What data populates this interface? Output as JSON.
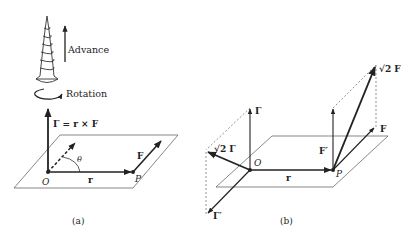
{
  "figure": {
    "panel_a": {
      "caption": "(a)",
      "screw": {
        "advance_label": "Advance",
        "rotation_label": "Rotation"
      },
      "torque_label": "Γ = r × F",
      "origin_label": "O",
      "point_label": "P",
      "r_label": "r",
      "force_label": "F",
      "angle_label": "θ"
    },
    "panel_b": {
      "caption": "(b)",
      "gamma_label": "Γ",
      "sqrt2_gamma_label": "√2 Γ",
      "gamma_prime_label": "Γ′",
      "origin_label": "O",
      "point_label": "P",
      "r_label": "r",
      "f_prime_label": "F′",
      "sqrt2_f_label": "√2 F",
      "force_label": "F"
    },
    "colors": {
      "ink": "#222222",
      "plane": "#555555",
      "background": "#ffffff"
    }
  }
}
